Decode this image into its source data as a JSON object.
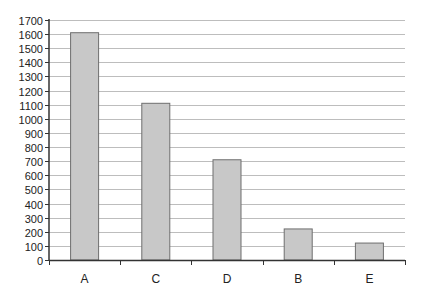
{
  "chart_data": {
    "type": "bar",
    "title": "",
    "xlabel": "",
    "ylabel": "",
    "categories": [
      "A",
      "C",
      "D",
      "B",
      "E"
    ],
    "values": [
      1610,
      1110,
      710,
      220,
      120
    ],
    "ylim": [
      0,
      1700
    ],
    "yticks": [
      0,
      100,
      200,
      300,
      400,
      500,
      600,
      700,
      800,
      900,
      1000,
      1100,
      1200,
      1300,
      1400,
      1500,
      1600,
      1700
    ],
    "grid": true,
    "legend": null,
    "colors": {
      "bar_fill": "#c8c8c8",
      "bar_stroke": "#6e6e6e",
      "grid": "#bdbdbd",
      "axis": "#333333"
    }
  }
}
